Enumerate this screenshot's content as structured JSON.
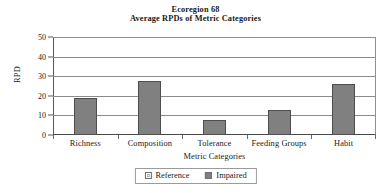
{
  "chart_data": {
    "type": "bar",
    "title": "Ecoregion 68",
    "subtitle": "Average RPDs of Metric Categories",
    "xlabel": "Metric Categories",
    "ylabel": "RPD",
    "categories": [
      "Richness",
      "Composition",
      "Tolerance",
      "Feeding Groups",
      "Habit"
    ],
    "series": [
      {
        "name": "Reference",
        "values": [
          0,
          0,
          0,
          0,
          0
        ],
        "color": "#ffffff"
      },
      {
        "name": "Impaired",
        "values": [
          19,
          27.5,
          7.5,
          13,
          26
        ],
        "color": "#808080"
      }
    ],
    "ylim": [
      0,
      50
    ],
    "ytick_labels": [
      "50",
      "40",
      "30",
      "20",
      "10",
      "0"
    ],
    "ytick_values": [
      50,
      40,
      30,
      20,
      10,
      0
    ],
    "grid": true,
    "legend_position": "bottom-center"
  },
  "legend": {
    "entries": [
      {
        "label": "Reference",
        "swatch": "legend-swatch-reference"
      },
      {
        "label": "Impaired",
        "swatch": "legend-swatch-impaired"
      }
    ]
  }
}
